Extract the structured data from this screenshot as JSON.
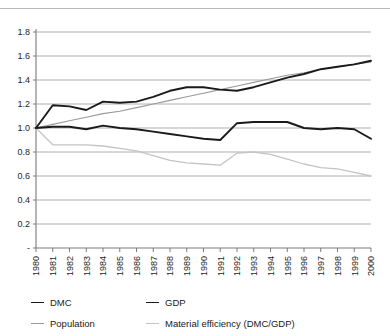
{
  "figure": {
    "cut_off_header_text": "",
    "has_top_rule": true
  },
  "legend": {
    "position": "bottom",
    "entries": [
      {
        "label": "DMC",
        "color": "#1a1a1a",
        "width": 1.9
      },
      {
        "label": "GDP",
        "color": "#1a1a1a",
        "width": 1.9
      },
      {
        "label": "Population",
        "color": "#9a9a9a",
        "width": 1.1
      },
      {
        "label": "Material efficiency (DMC/GDP)",
        "color": "#c4c4c4",
        "width": 1.3
      }
    ]
  },
  "chart_data": {
    "type": "line",
    "title": "",
    "subtitle": "",
    "xlabel": "",
    "ylabel": "",
    "xlim": [
      1980,
      2000
    ],
    "ylim": [
      0,
      1.8
    ],
    "grid": true,
    "grid_axis": "y",
    "legend_position": "bottom",
    "y_ticks": [
      "-",
      "0.2",
      "0.4",
      "0.6",
      "0.8",
      "1.0",
      "1.2",
      "1.4",
      "1.6",
      "1.8"
    ],
    "y_tick_values": [
      0,
      0.2,
      0.4,
      0.6,
      0.8,
      1.0,
      1.2,
      1.4,
      1.6,
      1.8
    ],
    "categories": [
      1980,
      1981,
      1982,
      1983,
      1984,
      1985,
      1986,
      1987,
      1988,
      1989,
      1990,
      1991,
      1992,
      1993,
      1994,
      1995,
      1996,
      1997,
      1998,
      1999,
      2000
    ],
    "x_tick_labels": [
      "1980",
      "1981",
      "1982",
      "1983",
      "1984",
      "1985",
      "1986",
      "1987",
      "1988",
      "1989",
      "1990",
      "1991",
      "1992",
      "1993",
      "1994",
      "1995",
      "1996",
      "1997",
      "1998",
      "1999",
      "2000"
    ],
    "series": [
      {
        "name": "GDP",
        "color": "#1a1a1a",
        "width": 1.9,
        "values": [
          1.0,
          1.19,
          1.18,
          1.15,
          1.22,
          1.21,
          1.22,
          1.26,
          1.31,
          1.34,
          1.34,
          1.32,
          1.31,
          1.34,
          1.38,
          1.42,
          1.45,
          1.49,
          1.51,
          1.53,
          1.56
        ]
      },
      {
        "name": "DMC",
        "color": "#1a1a1a",
        "width": 1.9,
        "values": [
          1.0,
          1.01,
          1.01,
          0.99,
          1.02,
          1.0,
          0.99,
          0.97,
          0.95,
          0.93,
          0.91,
          0.9,
          1.04,
          1.05,
          1.05,
          1.05,
          1.0,
          0.99,
          1.0,
          0.99,
          0.91
        ]
      },
      {
        "name": "Population",
        "color": "#9a9a9a",
        "width": 1.1,
        "values": [
          1.0,
          1.03,
          1.06,
          1.09,
          1.12,
          1.14,
          1.17,
          1.2,
          1.23,
          1.26,
          1.29,
          1.32,
          1.35,
          1.38,
          1.41,
          1.44,
          1.46,
          1.49,
          1.51,
          1.53,
          1.55
        ]
      },
      {
        "name": "Material efficiency (DMC/GDP)",
        "color": "#c4c4c4",
        "width": 1.3,
        "values": [
          1.0,
          0.86,
          0.86,
          0.86,
          0.85,
          0.83,
          0.81,
          0.77,
          0.73,
          0.71,
          0.7,
          0.69,
          0.79,
          0.8,
          0.78,
          0.74,
          0.7,
          0.67,
          0.66,
          0.63,
          0.6
        ]
      }
    ]
  }
}
